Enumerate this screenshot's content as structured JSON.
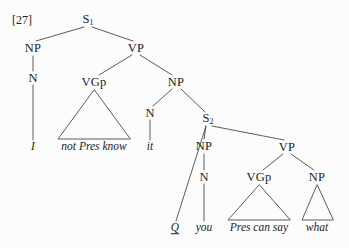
{
  "figure": {
    "example_number": "[27]",
    "caption": "",
    "background_color": "#fcfcfc",
    "line_color": "#4a4a4a",
    "text_color": "#1d1d1d"
  },
  "nodes": [
    {
      "id": "S1",
      "label": "S",
      "subscript": "1",
      "x": 88,
      "y": 20
    },
    {
      "id": "NP1",
      "label": "NP",
      "subscript": "",
      "x": 33,
      "y": 48
    },
    {
      "id": "VP1",
      "label": "VP",
      "subscript": "",
      "x": 136,
      "y": 48
    },
    {
      "id": "N1",
      "label": "N",
      "subscript": "",
      "x": 33,
      "y": 78
    },
    {
      "id": "VGp1",
      "label": "VGp",
      "subscript": "",
      "x": 94,
      "y": 82
    },
    {
      "id": "NP2",
      "label": "NP",
      "subscript": "",
      "x": 176,
      "y": 82
    },
    {
      "id": "N2",
      "label": "N",
      "subscript": "",
      "x": 150,
      "y": 113
    },
    {
      "id": "S2",
      "label": "S",
      "subscript": "2",
      "x": 208,
      "y": 119
    },
    {
      "id": "NP3",
      "label": "NP",
      "subscript": "",
      "x": 204,
      "y": 146
    },
    {
      "id": "VP2",
      "label": "VP",
      "subscript": "",
      "x": 287,
      "y": 147
    },
    {
      "id": "N3",
      "label": "N",
      "subscript": "",
      "x": 204,
      "y": 177
    },
    {
      "id": "VGp2",
      "label": "VGp",
      "subscript": "",
      "x": 259,
      "y": 177
    },
    {
      "id": "NP4",
      "label": "NP",
      "subscript": "",
      "x": 317,
      "y": 177
    }
  ],
  "leaves": [
    {
      "id": "leaf-i",
      "text": "I",
      "x": 33,
      "y": 147,
      "underlined": false
    },
    {
      "id": "leaf-not-pres-know",
      "text": "not Pres know",
      "x": 94,
      "y": 147,
      "underlined": false
    },
    {
      "id": "leaf-it",
      "text": "it",
      "x": 150,
      "y": 147,
      "underlined": false
    },
    {
      "id": "leaf-q",
      "text": "Q",
      "x": 175,
      "y": 228,
      "underlined": true
    },
    {
      "id": "leaf-you",
      "text": "you",
      "x": 204,
      "y": 228,
      "underlined": false
    },
    {
      "id": "leaf-pres-can-say",
      "text": "Pres can say",
      "x": 259,
      "y": 228,
      "underlined": false
    },
    {
      "id": "leaf-what",
      "text": "what",
      "x": 317,
      "y": 228,
      "underlined": false
    }
  ],
  "edges": [
    {
      "from": "S1",
      "to": "NP1",
      "x1": 84,
      "y1": 27,
      "x2": 36,
      "y2": 41
    },
    {
      "from": "S1",
      "to": "VP1",
      "x1": 92,
      "y1": 27,
      "x2": 133,
      "y2": 41
    },
    {
      "from": "NP1",
      "to": "N1",
      "x1": 33,
      "y1": 56,
      "x2": 33,
      "y2": 71
    },
    {
      "from": "N1",
      "to": "leafI",
      "x1": 33,
      "y1": 85,
      "x2": 33,
      "y2": 140
    },
    {
      "from": "VP1",
      "to": "VGp1",
      "x1": 132,
      "y1": 55,
      "x2": 99,
      "y2": 75
    },
    {
      "from": "VP1",
      "to": "NP2",
      "x1": 140,
      "y1": 55,
      "x2": 172,
      "y2": 75
    },
    {
      "from": "NP2",
      "to": "N2",
      "x1": 172,
      "y1": 89,
      "x2": 153,
      "y2": 106
    },
    {
      "from": "NP2",
      "to": "S2",
      "x1": 181,
      "y1": 89,
      "x2": 205,
      "y2": 112
    },
    {
      "from": "N2",
      "to": "leafIt",
      "x1": 150,
      "y1": 120,
      "x2": 150,
      "y2": 140
    },
    {
      "from": "S2",
      "to": "leafQ",
      "x1": 206,
      "y1": 126,
      "x2": 176,
      "y2": 221
    },
    {
      "from": "S2",
      "to": "NP3",
      "x1": 206,
      "y1": 126,
      "x2": 204,
      "y2": 139
    },
    {
      "from": "S2",
      "to": "VP2",
      "x1": 212,
      "y1": 126,
      "x2": 284,
      "y2": 140
    },
    {
      "from": "NP3",
      "to": "N3",
      "x1": 204,
      "y1": 154,
      "x2": 204,
      "y2": 170
    },
    {
      "from": "N3",
      "to": "leafYou",
      "x1": 204,
      "y1": 184,
      "x2": 204,
      "y2": 221
    },
    {
      "from": "VP2",
      "to": "VGp2",
      "x1": 283,
      "y1": 154,
      "x2": 263,
      "y2": 170
    },
    {
      "from": "VP2",
      "to": "NP4",
      "x1": 291,
      "y1": 154,
      "x2": 314,
      "y2": 170
    }
  ],
  "triangles": [
    {
      "id": "tri-vgp1",
      "apex_x": 94,
      "apex_y": 90,
      "left_x": 58,
      "right_x": 130,
      "base_y": 139
    },
    {
      "id": "tri-vgp2",
      "apex_x": 259,
      "apex_y": 185,
      "left_x": 228,
      "right_x": 290,
      "base_y": 220
    },
    {
      "id": "tri-np4",
      "apex_x": 317,
      "apex_y": 185,
      "left_x": 302,
      "right_x": 333,
      "base_y": 220
    }
  ],
  "chart_data": {
    "type": "diagram",
    "surface_string": "I not Pres know it Q you Pres can say what",
    "tree_structure": {
      "label": "S1",
      "children": [
        {
          "label": "NP",
          "children": [
            {
              "label": "N",
              "children": [
                {
                  "label": "I",
                  "terminal": true
                }
              ]
            }
          ]
        },
        {
          "label": "VP",
          "children": [
            {
              "label": "VGp",
              "triangle": true,
              "children": [
                {
                  "label": "not Pres know",
                  "terminal": true
                }
              ]
            },
            {
              "label": "NP",
              "children": [
                {
                  "label": "N",
                  "children": [
                    {
                      "label": "it",
                      "terminal": true
                    }
                  ]
                },
                {
                  "label": "S2",
                  "children": [
                    {
                      "label": "Q",
                      "terminal": true,
                      "underlined": true
                    },
                    {
                      "label": "NP",
                      "children": [
                        {
                          "label": "N",
                          "children": [
                            {
                              "label": "you",
                              "terminal": true
                            }
                          ]
                        }
                      ]
                    },
                    {
                      "label": "VP",
                      "children": [
                        {
                          "label": "VGp",
                          "triangle": true,
                          "children": [
                            {
                              "label": "Pres can say",
                              "terminal": true
                            }
                          ]
                        },
                        {
                          "label": "NP",
                          "triangle": true,
                          "children": [
                            {
                              "label": "what",
                              "terminal": true
                            }
                          ]
                        }
                      ]
                    }
                  ]
                }
              ]
            }
          ]
        }
      ]
    }
  }
}
